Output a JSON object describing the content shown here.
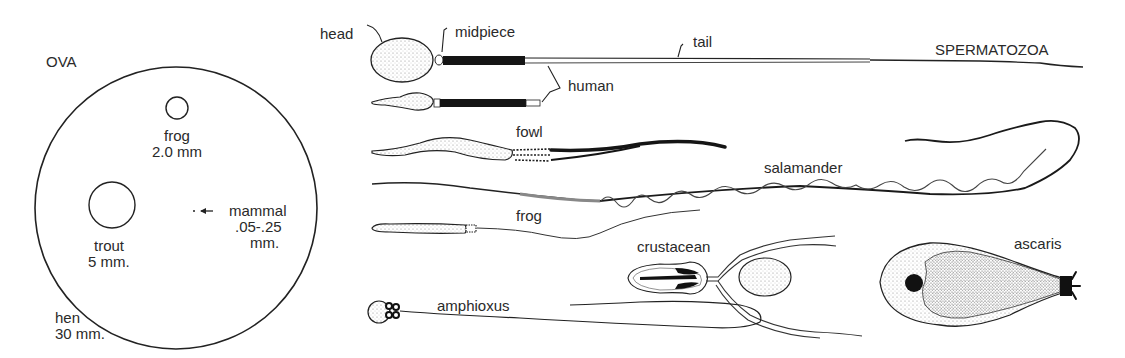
{
  "ova": {
    "title": "OVA",
    "hen": {
      "name": "hen",
      "size": "30 mm."
    },
    "frog": {
      "name": "frog",
      "size": "2.0 mm"
    },
    "trout": {
      "name": "trout",
      "size": "5 mm."
    },
    "mammal": {
      "name": "mammal",
      "size_line1": ".05-.25",
      "size_line2": "mm."
    }
  },
  "spermatozoa": {
    "title": "SPERMATOZOA",
    "parts": {
      "head": "head",
      "midpiece": "midpiece",
      "tail": "tail"
    },
    "species": {
      "human": "human",
      "fowl": "fowl",
      "salamander": "salamander",
      "frog": "frog",
      "crustacean": "crustacean",
      "ascaris": "ascaris",
      "amphioxus": "amphioxus"
    }
  },
  "colors": {
    "ink": "#222222",
    "background": "#ffffff",
    "stipple": "#9a9a9a"
  }
}
